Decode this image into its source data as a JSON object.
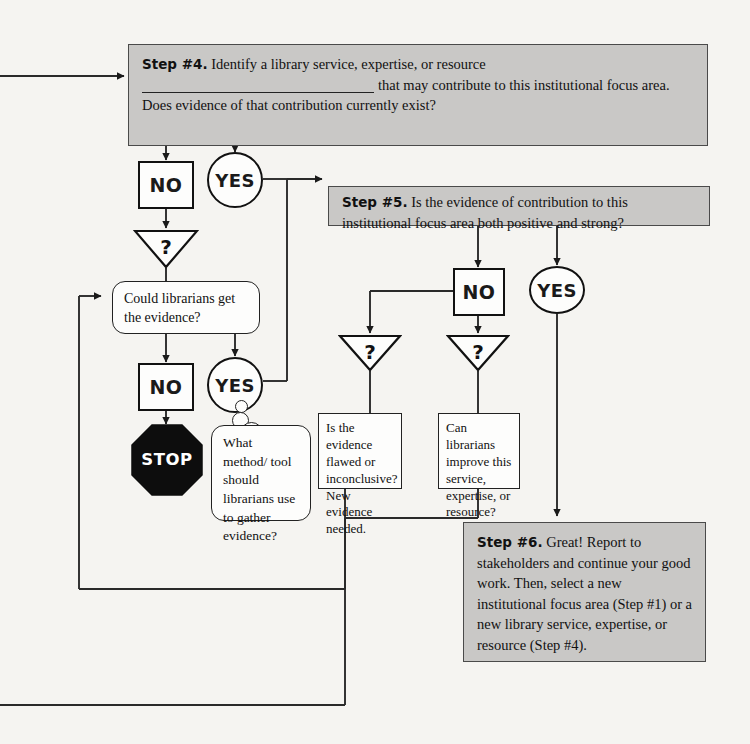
{
  "diagram": {
    "background_color": "#f5f4f1",
    "step_box_fill": "#c9c8c6",
    "line_color": "#222222"
  },
  "steps": {
    "step4": {
      "label": "Step #4.",
      "text_before_blank": "Identify a library service, expertise, or resource",
      "text_after_blank": "that may contribute to this institutional focus area. Does evidence of that contribution currently exist?"
    },
    "step5": {
      "label": "Step #5.",
      "text": "Is the evidence of contribution to this institutional focus area both positive and strong?"
    },
    "step6": {
      "label": "Step #6.",
      "text": "Great! Report to stakeholders and continue your good work. Then, select a new institutional focus area (Step #1) or a new library service, expertise, or resource (Step #4)."
    }
  },
  "decisions": {
    "no_label": "NO",
    "yes_label": "YES",
    "question_mark": "?",
    "stop_label": "STOP"
  },
  "boxes": {
    "could_librarians": "Could librarians get the evidence?",
    "what_method": "What method/ tool should librarians use to gather evidence?",
    "is_evidence_flawed": "Is the evidence flawed or inconclusive? New evidence needed.",
    "can_librarians_improve": "Can librarians improve this service, expertise, or resource?"
  }
}
